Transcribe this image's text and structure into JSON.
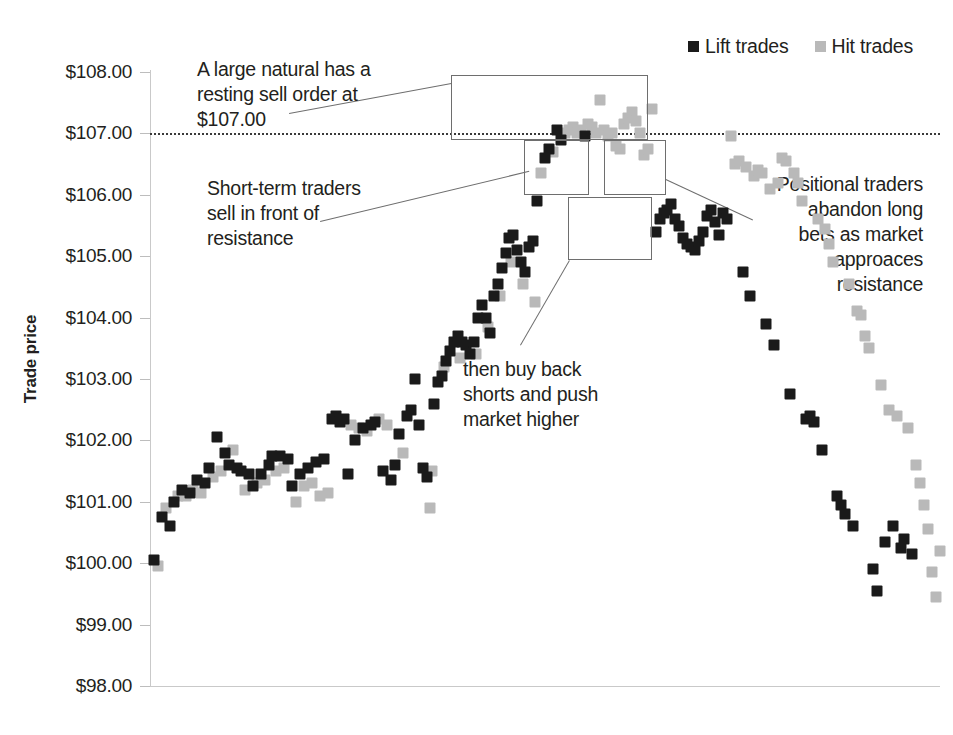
{
  "chart_data": {
    "type": "scatter",
    "title": "",
    "xlabel": "",
    "ylabel": "Trade price",
    "ylim": [
      98,
      108
    ],
    "ytick_labels": [
      "$108.00",
      "$107.00",
      "$106.00",
      "$105.00",
      "$104.00",
      "$103.00",
      "$102.00",
      "$101.00",
      "$100.00",
      "$99.00",
      "$98.00"
    ],
    "ytick_values": [
      108,
      107,
      106,
      105,
      104,
      103,
      102,
      101,
      100,
      99,
      98
    ],
    "xlim": [
      0,
      200
    ],
    "grid": false,
    "legend_position": "top-right",
    "reference_lines": [
      {
        "name": "resistance",
        "y": 107.0,
        "style": "dotted",
        "label": "$107.00"
      }
    ],
    "series": [
      {
        "name": "Lift trades",
        "color": "#1a1a1a",
        "marker": "square",
        "points": [
          [
            1,
            100.05
          ],
          [
            3,
            100.75
          ],
          [
            5,
            100.6
          ],
          [
            6,
            101.0
          ],
          [
            8,
            101.2
          ],
          [
            10,
            101.15
          ],
          [
            12,
            101.35
          ],
          [
            14,
            101.3
          ],
          [
            15,
            101.55
          ],
          [
            17,
            102.05
          ],
          [
            19,
            101.8
          ],
          [
            20,
            101.6
          ],
          [
            22,
            101.55
          ],
          [
            23,
            101.5
          ],
          [
            25,
            101.45
          ],
          [
            26,
            101.25
          ],
          [
            28,
            101.45
          ],
          [
            30,
            101.6
          ],
          [
            31,
            101.75
          ],
          [
            33,
            101.75
          ],
          [
            35,
            101.7
          ],
          [
            36,
            101.25
          ],
          [
            38,
            101.45
          ],
          [
            40,
            101.55
          ],
          [
            42,
            101.65
          ],
          [
            44,
            101.7
          ],
          [
            46,
            102.35
          ],
          [
            47,
            102.4
          ],
          [
            48,
            102.3
          ],
          [
            49,
            102.35
          ],
          [
            50,
            101.45
          ],
          [
            52,
            102.0
          ],
          [
            54,
            102.2
          ],
          [
            56,
            102.25
          ],
          [
            57,
            102.3
          ],
          [
            59,
            101.5
          ],
          [
            61,
            101.35
          ],
          [
            62,
            101.6
          ],
          [
            63,
            102.1
          ],
          [
            65,
            102.4
          ],
          [
            66,
            102.5
          ],
          [
            67,
            103.0
          ],
          [
            68,
            102.25
          ],
          [
            69,
            101.55
          ],
          [
            70,
            101.4
          ],
          [
            72,
            102.6
          ],
          [
            73,
            102.95
          ],
          [
            74,
            103.05
          ],
          [
            75,
            103.3
          ],
          [
            76,
            103.45
          ],
          [
            77,
            103.6
          ],
          [
            78,
            103.7
          ],
          [
            79,
            103.6
          ],
          [
            80,
            103.55
          ],
          [
            81,
            103.4
          ],
          [
            82,
            103.6
          ],
          [
            83,
            104.0
          ],
          [
            84,
            104.2
          ],
          [
            85,
            104.0
          ],
          [
            86,
            103.75
          ],
          [
            87,
            104.35
          ],
          [
            88,
            104.55
          ],
          [
            89,
            104.8
          ],
          [
            90,
            105.05
          ],
          [
            91,
            105.3
          ],
          [
            92,
            105.35
          ],
          [
            93,
            105.1
          ],
          [
            94,
            104.9
          ],
          [
            95,
            104.75
          ],
          [
            96,
            105.15
          ],
          [
            97,
            105.25
          ],
          [
            98,
            105.9
          ],
          [
            100,
            106.6
          ],
          [
            101,
            106.75
          ],
          [
            103,
            107.05
          ],
          [
            104,
            106.9
          ],
          [
            110,
            106.95
          ],
          [
            128,
            105.4
          ],
          [
            129,
            105.6
          ],
          [
            130,
            105.7
          ],
          [
            131,
            105.75
          ],
          [
            132,
            105.85
          ],
          [
            133,
            105.6
          ],
          [
            134,
            105.5
          ],
          [
            135,
            105.3
          ],
          [
            136,
            105.2
          ],
          [
            137,
            105.15
          ],
          [
            138,
            105.1
          ],
          [
            139,
            105.25
          ],
          [
            140,
            105.4
          ],
          [
            141,
            105.65
          ],
          [
            142,
            105.75
          ],
          [
            143,
            105.55
          ],
          [
            144,
            105.35
          ],
          [
            145,
            105.7
          ],
          [
            146,
            105.6
          ],
          [
            150,
            104.75
          ],
          [
            152,
            104.35
          ],
          [
            156,
            103.9
          ],
          [
            158,
            103.55
          ],
          [
            162,
            102.75
          ],
          [
            166,
            102.35
          ],
          [
            167,
            102.4
          ],
          [
            168,
            102.3
          ],
          [
            170,
            101.85
          ],
          [
            174,
            101.1
          ],
          [
            175,
            100.95
          ],
          [
            176,
            100.8
          ],
          [
            178,
            100.6
          ],
          [
            183,
            99.9
          ],
          [
            184,
            99.55
          ],
          [
            186,
            100.35
          ],
          [
            188,
            100.6
          ],
          [
            190,
            100.25
          ],
          [
            191,
            100.4
          ],
          [
            193,
            100.15
          ]
        ]
      },
      {
        "name": "Hit trades",
        "color": "#b9b9b9",
        "marker": "square",
        "points": [
          [
            2,
            99.95
          ],
          [
            4,
            100.9
          ],
          [
            7,
            101.1
          ],
          [
            9,
            101.1
          ],
          [
            11,
            101.2
          ],
          [
            13,
            101.15
          ],
          [
            16,
            101.4
          ],
          [
            18,
            101.5
          ],
          [
            21,
            101.85
          ],
          [
            24,
            101.2
          ],
          [
            27,
            101.3
          ],
          [
            29,
            101.35
          ],
          [
            32,
            101.5
          ],
          [
            34,
            101.55
          ],
          [
            37,
            101.0
          ],
          [
            39,
            101.25
          ],
          [
            41,
            101.3
          ],
          [
            43,
            101.1
          ],
          [
            45,
            101.15
          ],
          [
            51,
            102.25
          ],
          [
            53,
            102.2
          ],
          [
            55,
            102.15
          ],
          [
            58,
            102.35
          ],
          [
            60,
            102.25
          ],
          [
            64,
            101.8
          ],
          [
            71,
            100.9
          ],
          [
            71.5,
            101.5
          ],
          [
            74.5,
            103.2
          ],
          [
            78.5,
            103.35
          ],
          [
            82.5,
            103.4
          ],
          [
            85.5,
            103.85
          ],
          [
            88.5,
            104.35
          ],
          [
            91.5,
            104.9
          ],
          [
            94.5,
            104.55
          ],
          [
            97.5,
            104.25
          ],
          [
            99,
            106.35
          ],
          [
            102,
            106.7
          ],
          [
            105,
            107.0
          ],
          [
            106,
            107.05
          ],
          [
            107,
            107.1
          ],
          [
            108,
            107.0
          ],
          [
            109,
            107.05
          ],
          [
            111,
            107.15
          ],
          [
            112,
            107.1
          ],
          [
            113,
            107.0
          ],
          [
            114,
            107.55
          ],
          [
            115,
            107.05
          ],
          [
            116,
            106.95
          ],
          [
            117,
            107.0
          ],
          [
            118,
            106.8
          ],
          [
            119,
            106.75
          ],
          [
            120,
            107.15
          ],
          [
            121,
            107.25
          ],
          [
            122,
            107.35
          ],
          [
            123,
            107.2
          ],
          [
            124,
            107.0
          ],
          [
            125,
            106.65
          ],
          [
            126,
            106.75
          ],
          [
            127,
            107.4
          ],
          [
            147,
            106.95
          ],
          [
            148,
            106.5
          ],
          [
            149,
            106.55
          ],
          [
            151,
            106.45
          ],
          [
            153,
            106.3
          ],
          [
            154,
            106.4
          ],
          [
            155,
            106.35
          ],
          [
            157,
            106.1
          ],
          [
            159,
            106.2
          ],
          [
            160,
            106.6
          ],
          [
            161,
            106.55
          ],
          [
            163,
            106.35
          ],
          [
            164,
            106.2
          ],
          [
            165,
            105.9
          ],
          [
            169,
            105.6
          ],
          [
            171,
            105.45
          ],
          [
            172,
            105.2
          ],
          [
            173,
            104.9
          ],
          [
            177,
            104.55
          ],
          [
            179,
            104.1
          ],
          [
            180,
            104.05
          ],
          [
            181,
            103.7
          ],
          [
            182,
            103.5
          ],
          [
            185,
            102.9
          ],
          [
            187,
            102.5
          ],
          [
            189,
            102.4
          ],
          [
            192,
            102.2
          ],
          [
            194,
            101.6
          ],
          [
            195,
            101.3
          ],
          [
            196,
            100.95
          ],
          [
            197,
            100.55
          ],
          [
            198,
            99.85
          ],
          [
            199,
            99.45
          ],
          [
            200,
            100.2
          ]
        ]
      }
    ],
    "annotations": [
      {
        "id": "a1",
        "text": "A large natural has a resting sell order at $107.00",
        "lines": [
          "A large natural has a",
          "resting sell order at",
          "$107.00"
        ],
        "align": "left"
      },
      {
        "id": "a2",
        "text": "Short-term traders sell in front of resistance",
        "lines": [
          "Short-term traders",
          "sell in front of",
          "resistance"
        ],
        "align": "left"
      },
      {
        "id": "a3",
        "text": "then buy back shorts and push market higher",
        "lines": [
          "then buy back",
          "shorts and push",
          "market higher"
        ],
        "align": "left"
      },
      {
        "id": "a4",
        "text": "Positional traders abandon long bets as market approaces resistance",
        "lines": [
          "Positional traders",
          "abandon long",
          "bets as market",
          "approaces",
          "resistance"
        ],
        "align": "right"
      }
    ],
    "highlight_boxes": [
      {
        "id": "box-resting-order",
        "x0": 451,
        "y0": 75,
        "x1": 648,
        "y1": 140
      },
      {
        "id": "box-short-term-sell",
        "x0": 524,
        "y0": 140,
        "x1": 589,
        "y1": 195
      },
      {
        "id": "box-positional-abandon",
        "x0": 604,
        "y0": 140,
        "x1": 666,
        "y1": 195
      },
      {
        "id": "box-buy-back-shorts",
        "x0": 568,
        "y0": 197,
        "x1": 652,
        "y1": 260
      }
    ]
  },
  "legend": {
    "items": [
      {
        "label": "Lift trades",
        "color": "#1a1a1a",
        "swatch": "square-dark"
      },
      {
        "label": "Hit trades",
        "color": "#b9b9b9",
        "swatch": "square-light"
      }
    ]
  },
  "axis": {
    "y_title": "Trade price",
    "y_ticks": [
      "$108.00",
      "$107.00",
      "$106.00",
      "$105.00",
      "$104.00",
      "$103.00",
      "$102.00",
      "$101.00",
      "$100.00",
      "$99.00",
      "$98.00"
    ]
  },
  "annotations": {
    "resting_order": {
      "l1": "A large natural has a",
      "l2": "resting sell order at",
      "l3": "$107.00"
    },
    "short_term": {
      "l1": "Short-term traders",
      "l2": "sell in front of",
      "l3": "resistance"
    },
    "buy_back": {
      "l1": "then buy back",
      "l2": "shorts and push",
      "l3": "market higher"
    },
    "positional": {
      "l1": "Positional traders",
      "l2": "abandon long",
      "l3": "bets as market",
      "l4": "approaces",
      "l5": "resistance"
    }
  }
}
